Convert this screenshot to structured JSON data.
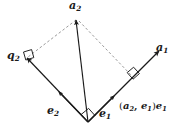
{
  "figure": {
    "background_color": "#ffffff",
    "stroke_color": "#1a1a1a",
    "dashed_color": "#8c8c8c",
    "width": 179,
    "height": 129
  },
  "labels": {
    "a2": {
      "base": "a",
      "sub": "2"
    },
    "a1": {
      "base": "a",
      "sub": "1"
    },
    "q2": {
      "base": "q",
      "sub": "2"
    },
    "e2": {
      "base": "e",
      "sub": "2"
    },
    "e1": {
      "base": "e",
      "sub": "1"
    },
    "projection": {
      "open_paren": "(",
      "first": "a",
      "first_sub": "2",
      "comma": ", ",
      "second": "e",
      "second_sub": "1",
      "close_paren": ")",
      "scalar_vector": "e",
      "scalar_vector_sub": "1"
    }
  },
  "geometry": {
    "origin": {
      "x": 88,
      "y": 122
    },
    "a2_tip": {
      "x": 76,
      "y": 18
    },
    "a1_tip": {
      "x": 160,
      "y": 50
    },
    "q2_tip": {
      "x": 26,
      "y": 58
    },
    "e2_tip": {
      "x": 26,
      "y": 58
    },
    "projection_point": {
      "x": 133,
      "y": 78
    },
    "right_angle_markers": [
      "origin",
      "q2-tip",
      "projection-point"
    ],
    "solid_vectors": [
      "a2",
      "a1",
      "e1",
      "e2"
    ],
    "dashed_lines": [
      "a2-to-q2",
      "a2-to-projection"
    ]
  }
}
